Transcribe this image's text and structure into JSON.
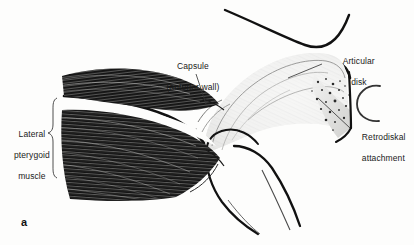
{
  "figure": {
    "panel_letter": "a",
    "background_color": "#fdfdfc",
    "ink_color": "#111111",
    "labels": {
      "capsule_line1": "Capsule",
      "capsule_line2": "(anterior wall)",
      "lateral_pterygoid_line1": "Lateral",
      "lateral_pterygoid_line2": "pterygoid",
      "lateral_pterygoid_line3": "muscle",
      "articular_disk_line1": "Articular",
      "articular_disk_line2": "disk",
      "retrodiskal_line1": "Retrodiskal",
      "retrodiskal_line2": "attachment"
    },
    "structures": [
      "temporal-bone-articular-eminence",
      "articular-disk",
      "mandibular-condyle",
      "lateral-pterygoid-muscle-superior-head",
      "lateral-pterygoid-muscle-inferior-head",
      "retrodiskal-attachment",
      "external-auditory-meatus",
      "joint-capsule-anterior-wall"
    ]
  }
}
